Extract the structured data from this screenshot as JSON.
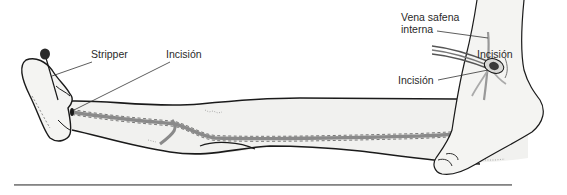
{
  "figure": {
    "left_panel": {
      "name": "leg-stripping-view",
      "labels": {
        "stripper": "Stripper",
        "incision_ankle": "Incisión",
        "incision_groin": "Incisión"
      }
    },
    "right_panel": {
      "name": "ankle-detail-view",
      "labels": {
        "vein": "Vena safena\ninterna",
        "incision": "Incisión"
      }
    }
  },
  "colors": {
    "outline": "#1a1a1a",
    "skin": "#f2f2f0",
    "vein": "#8a8a8a",
    "label_text": "#2a2a2a",
    "rule": "#888888"
  }
}
